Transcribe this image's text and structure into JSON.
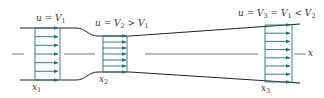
{
  "diagram": {
    "colors": {
      "wall": "#222222",
      "profile": "#1f6f7a",
      "arrow": "#1f6f7a",
      "centerline": "#555555",
      "text": "#333333"
    },
    "labels": {
      "section1_velocity": {
        "main": "u = V",
        "sub": "1",
        "rest": ""
      },
      "section2_velocity": {
        "main": "u = V",
        "sub": "2",
        "rest": " > V",
        "sub2": "1"
      },
      "section3_velocity": {
        "main": "u = V",
        "sub": "3",
        "rest": " = V",
        "sub2": "1",
        "rest2": " < V",
        "sub3": "2"
      },
      "x1": {
        "main": "x",
        "sub": "1"
      },
      "x2": {
        "main": "x",
        "sub": "2"
      },
      "x3": {
        "main": "x",
        "sub": "3"
      },
      "axis": "x"
    },
    "sections": [
      {
        "name": "section-1",
        "x_left": 35,
        "x_right": 60,
        "y_top": 28,
        "y_bottom": 80,
        "arrow_count": 7
      },
      {
        "name": "section-2",
        "x_left": 103,
        "x_right": 127,
        "y_top": 36,
        "y_bottom": 72,
        "arrow_count": 7
      },
      {
        "name": "section-3",
        "x_left": 265,
        "x_right": 292,
        "y_top": 24,
        "y_bottom": 83,
        "arrow_count": 8
      }
    ]
  }
}
